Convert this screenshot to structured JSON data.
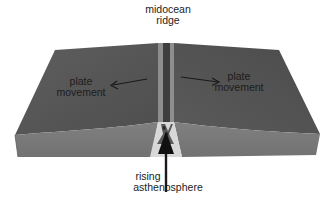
{
  "diagram": {
    "labels": {
      "ridge": [
        "midocean",
        "ridge"
      ],
      "left_plate": [
        "plate",
        "movement"
      ],
      "right_plate": [
        "plate",
        "movement"
      ],
      "rising": [
        "rising",
        "asthenosphere"
      ]
    },
    "arrows": {
      "left_plate": "arrow pointing left (away from ridge)",
      "right_plate": "arrow pointing right (away from ridge)",
      "rising": "arrow pointing up (into ridge)"
    },
    "colors": {
      "plate_top": "#575757",
      "plate_top_dark": "#4a4a4a",
      "plate_side": "#7a7a7a",
      "ridge_light": "#8e8e8e",
      "ridge_dark": "#404040",
      "magma": "#d8d8d8",
      "text": "#1c1c1c",
      "arrow": "#1a1a1a"
    }
  }
}
